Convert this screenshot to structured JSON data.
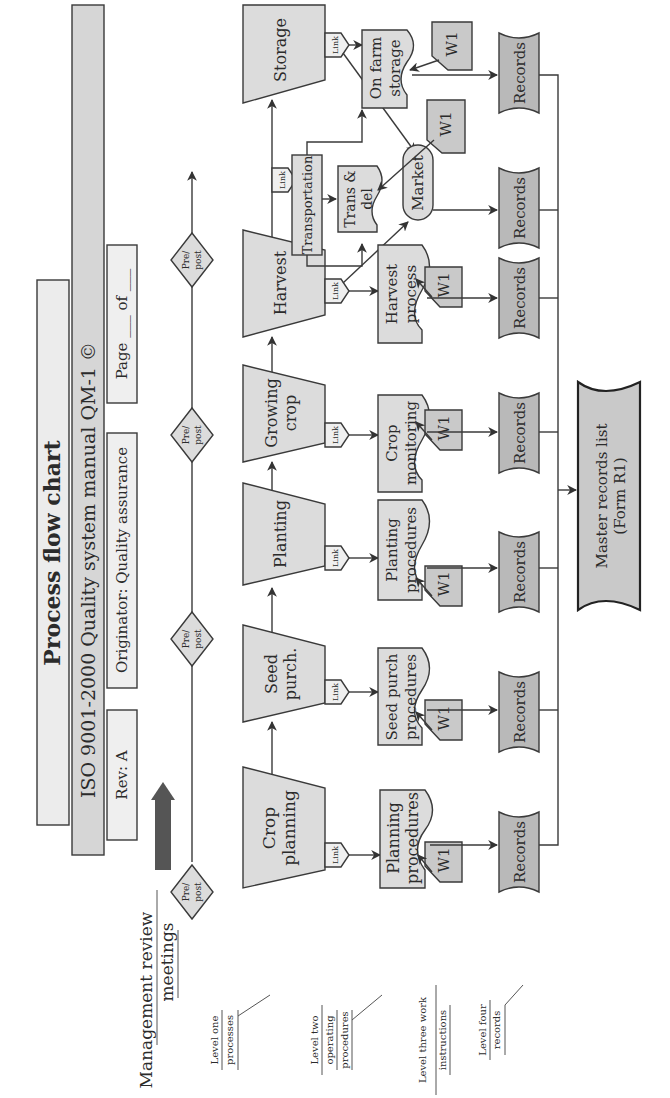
{
  "header": {
    "title": "Process flow chart",
    "subtitle": "ISO 9001-2000 Quality system manual QM-1 ©",
    "rev": "Rev: A",
    "originator": "Originator: Quality assurance",
    "page": "Page ___ of ___"
  },
  "management": {
    "line1": "Management review",
    "line2": "meetings"
  },
  "prepost": {
    "line1": "Pre/",
    "line2": "post"
  },
  "levels": {
    "one": {
      "line1": "Level one",
      "line2": "processes"
    },
    "two": {
      "line1": "Level two",
      "line2": "operating",
      "line3": "procedures"
    },
    "three": {
      "line1": "Level three work",
      "line2": "instructions"
    },
    "four": {
      "line1": "Level four",
      "line2": "records"
    }
  },
  "processes": [
    {
      "line1": "Crop",
      "line2": "planning"
    },
    {
      "line1": "Seed",
      "line2": "purch."
    },
    {
      "line1": "Planting",
      "line2": ""
    },
    {
      "line1": "Growing",
      "line2": "crop"
    },
    {
      "line1": "Harvest",
      "line2": ""
    },
    {
      "line1": "Storage",
      "line2": ""
    }
  ],
  "link_label": "Link",
  "procedures": [
    {
      "line1": "Planning",
      "line2": "procedures"
    },
    {
      "line1": "Seed purch",
      "line2": "procedures"
    },
    {
      "line1": "Planting",
      "line2": "procedures"
    },
    {
      "line1": "Crop",
      "line2": "monitoring"
    },
    {
      "line1": "Harvest",
      "line2": "process"
    },
    {
      "line1": "Trans &",
      "line2": "del"
    },
    {
      "line1": "On farm",
      "line2": "storage"
    }
  ],
  "transportation": "Transportation",
  "market": "Market",
  "work_instruction": "W1",
  "records_label": "Records",
  "master": {
    "line1": "Master records list",
    "line2": "(Form R1)"
  },
  "colors": {
    "fill_light": "#dcdcdc",
    "fill_mid": "#c9c9c9",
    "fill_dark": "#b9b9b9",
    "arrow_dark": "#555555",
    "line": "#3a3a3a"
  }
}
